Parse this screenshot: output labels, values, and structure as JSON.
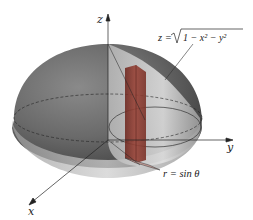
{
  "figure": {
    "type": "3d-surface-diagram",
    "axes": {
      "x_label": "x",
      "y_label": "y",
      "z_label": "z"
    },
    "annotations": {
      "surface_equation_lhs": "z = ",
      "surface_equation_radicand": "1 − x² − y²",
      "surface_equation": "z = √(1 − x² − y²)",
      "region_equation": "r = sin θ"
    },
    "colors": {
      "hemisphere": "#6e6e6e",
      "cylinder": "#d8d8d8",
      "prism": "#8a3a30",
      "axes": "#222222"
    }
  }
}
